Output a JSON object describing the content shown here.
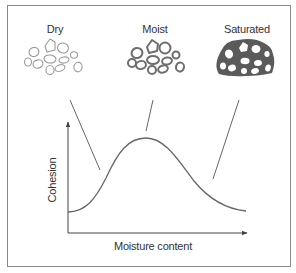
{
  "figure": {
    "states": [
      {
        "id": "dry",
        "label": "Dry"
      },
      {
        "id": "moist",
        "label": "Moist"
      },
      {
        "id": "saturated",
        "label": "Saturated"
      }
    ],
    "axes": {
      "y_label": "Cohesion",
      "x_label": "Moisture content"
    },
    "colors": {
      "frame": "#8a8a8a",
      "line": "#555555",
      "dry_pebble_outline": "#9a9a9a",
      "moist_pebble_outline": "#6e6e6e",
      "saturated_fill": "#5a5a5a",
      "text": "#333333"
    },
    "curve_description": "Bell-shaped curve: low cohesion when dry, peak cohesion when moist, low cohesion when saturated"
  }
}
